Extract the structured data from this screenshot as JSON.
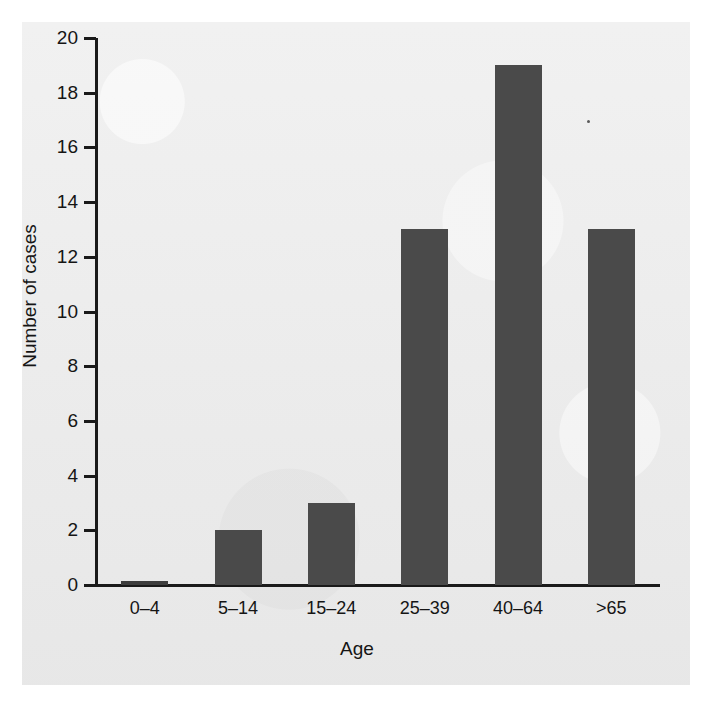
{
  "chart_data": {
    "type": "bar",
    "title": "",
    "xlabel": "Age",
    "ylabel": "Number of cases",
    "categories": [
      "0–4",
      "5–14",
      "15–24",
      "25–39",
      "40–64",
      ">65"
    ],
    "values": [
      0,
      2,
      3,
      13,
      19,
      13
    ],
    "ylim": [
      0,
      20
    ],
    "yticks": [
      0,
      2,
      4,
      6,
      8,
      10,
      12,
      14,
      16,
      18,
      20
    ],
    "ytick_labels": [
      "0",
      "2",
      "4",
      "6",
      "8",
      "10",
      "12",
      "14",
      "16",
      "18",
      "20"
    ],
    "grid": false,
    "legend": null,
    "bar_color": "#4a4a4a",
    "axis_color": "#1a1a1a",
    "background_color": "#ebebeb"
  },
  "axes": {
    "y_title": "Number of cases",
    "x_title": "Age"
  }
}
